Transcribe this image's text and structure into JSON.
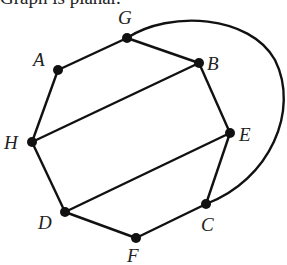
{
  "caption": "Graph is planar.",
  "graph": {
    "nodes": [
      {
        "id": "G",
        "label": "G",
        "x": 127,
        "y": 38,
        "lx": 118,
        "ly": 24
      },
      {
        "id": "A",
        "label": "A",
        "x": 58,
        "y": 70,
        "lx": 33,
        "ly": 66
      },
      {
        "id": "B",
        "label": "B",
        "x": 199,
        "y": 63,
        "lx": 207,
        "ly": 70
      },
      {
        "id": "H",
        "label": "H",
        "x": 32,
        "y": 142,
        "lx": 4,
        "ly": 149
      },
      {
        "id": "E",
        "label": "E",
        "x": 230,
        "y": 133,
        "lx": 239,
        "ly": 141
      },
      {
        "id": "D",
        "label": "D",
        "x": 65,
        "y": 212,
        "lx": 38,
        "ly": 229
      },
      {
        "id": "C",
        "label": "C",
        "x": 206,
        "y": 204,
        "lx": 201,
        "ly": 231
      },
      {
        "id": "F",
        "label": "F",
        "x": 136,
        "y": 238,
        "lx": 127,
        "ly": 262
      }
    ],
    "edges": [
      [
        "G",
        "A"
      ],
      [
        "G",
        "B"
      ],
      [
        "A",
        "H"
      ],
      [
        "B",
        "H"
      ],
      [
        "B",
        "E"
      ],
      [
        "H",
        "D"
      ],
      [
        "E",
        "D"
      ],
      [
        "E",
        "C"
      ],
      [
        "D",
        "F"
      ],
      [
        "F",
        "C"
      ],
      [
        "G",
        "C",
        "arc"
      ]
    ],
    "arc_path": "M127,38 C170,10 250,15 275,60 C300,110 270,180 206,204",
    "node_color": "#111111",
    "edge_color": "#111111"
  }
}
